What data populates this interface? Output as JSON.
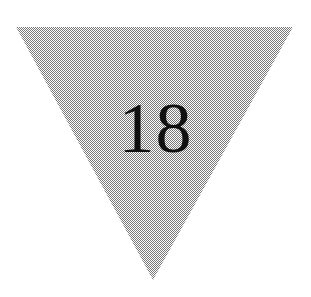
{
  "figure": {
    "type": "geometric-shape-figure",
    "background_color": "#ffffff",
    "width": 311,
    "height": 297,
    "shape": {
      "name": "inverted-triangle",
      "label": "18",
      "fill_color": "#a9a9a9",
      "fill_pattern": "checkerboard-dither-50",
      "pattern_colors": [
        "#000000",
        "#ffffff"
      ],
      "orientation": "point-down",
      "vertices": [
        {
          "x": 16,
          "y": 27
        },
        {
          "x": 293,
          "y": 27
        },
        {
          "x": 153,
          "y": 280
        }
      ]
    },
    "label_style": {
      "color": "#101010",
      "font_size_px": 72,
      "center_x": 153,
      "baseline_y": 150
    }
  }
}
